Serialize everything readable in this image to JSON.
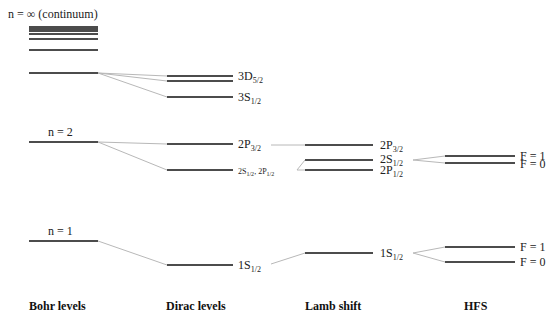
{
  "diagram": {
    "title_label": "n = ∞ (continuum)",
    "columns": [
      {
        "id": "bohr",
        "label": "Bohr levels"
      },
      {
        "id": "dirac",
        "label": "Dirac levels"
      },
      {
        "id": "lamb",
        "label": "Lamb shift"
      },
      {
        "id": "hfs",
        "label": "HFS"
      }
    ],
    "bohr": {
      "continuum_label": "n = ∞ (continuum)",
      "n2_label": "n = 2",
      "n1_label": "n = 1"
    },
    "dirac": {
      "d52": {
        "main": "3D",
        "sub": "5/2"
      },
      "s12_3": {
        "main": "3S",
        "sub": "1/2"
      },
      "p32": {
        "main": "2P",
        "sub": "3/2"
      },
      "s12p12": {
        "a": "2S",
        "a_sub": "1/2",
        "sep": ", ",
        "b": "2P",
        "b_sub": "1/2"
      },
      "s1": {
        "main": "1S",
        "sub": "1/2"
      }
    },
    "lamb": {
      "p32": {
        "main": "2P",
        "sub": "3/2"
      },
      "s12": {
        "main": "2S",
        "sub": "1/2"
      },
      "p12": {
        "main": "2P",
        "sub": "1/2"
      },
      "s1": {
        "main": "1S",
        "sub": "1/2"
      }
    },
    "hfs": {
      "n2_f1": "F = 1",
      "n2_f0": "F = 0",
      "n1_f1": "F = 1",
      "n1_f0": "F = 0"
    },
    "colors": {
      "level": "#111111",
      "connector": "#b8b8b8"
    }
  }
}
